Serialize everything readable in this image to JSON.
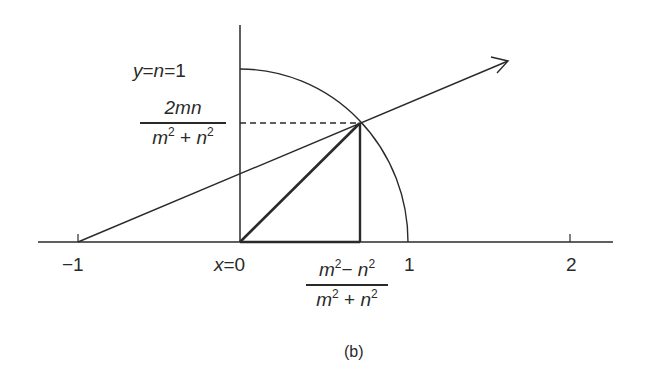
{
  "diagram": {
    "caption": "(b)",
    "labels": {
      "y_top": "y = n = 1",
      "y_top_parts": {
        "y": "y",
        "eq1": "=",
        "n": "n",
        "eq2": "=",
        "one": "1"
      },
      "y_point_num": "2mn",
      "y_point_den_m": "m",
      "y_point_den_plus": "+",
      "y_point_den_n": "n",
      "x_point_num_m": "m",
      "x_point_num_minus": "−",
      "x_point_num_n": "n",
      "x_point_den_m": "m",
      "x_point_den_plus": "+",
      "x_point_den_n": "n",
      "exp": "2",
      "x_zero_var": "x",
      "x_zero_eq": "=0",
      "tick_neg1": "−1",
      "tick_1": "1",
      "tick_2": "2"
    },
    "math": {
      "point_x": "(m^2 - n^2)/(m^2 + n^2)",
      "point_y": "2mn/(m^2 + n^2)",
      "line_through": [
        -1,
        0
      ],
      "circle_radius": 1
    }
  }
}
